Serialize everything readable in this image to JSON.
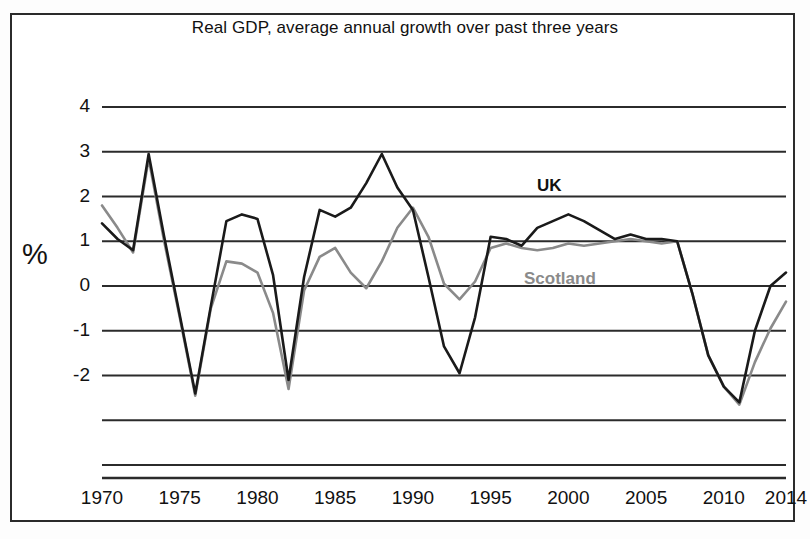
{
  "figure": {
    "title": "Real GDP, average annual growth over past three years",
    "ylabel": "%"
  },
  "legend": {
    "uk": "UK",
    "scotland": "Scotland"
  },
  "colors": {
    "uk": "#1a1a1a",
    "scotland": "#8a8a8a",
    "grid": "#2b2b2b",
    "frame": "#2b2b2b",
    "background": "#ffffff"
  },
  "axis": {
    "yticks": [
      "4",
      "3",
      "2",
      "1",
      "0",
      "-1",
      "-2"
    ],
    "ytick_values": [
      4,
      3,
      2,
      1,
      0,
      -1,
      -2
    ],
    "unlabeled_gridlines": [
      -3,
      -4
    ],
    "xticks": [
      "1970",
      "1975",
      "1980",
      "1985",
      "1990",
      "1995",
      "2000",
      "2005",
      "2010",
      "2014"
    ],
    "xtick_values": [
      1970,
      1975,
      1980,
      1985,
      1990,
      1995,
      2000,
      2005,
      2010,
      2014
    ]
  },
  "chart_data": {
    "type": "line",
    "title": "Real GDP, average annual growth over past three years",
    "xlabel": "",
    "ylabel": "%",
    "xlim": [
      1970,
      2014
    ],
    "ylim": [
      -4.3,
      4.3
    ],
    "grid": true,
    "legend_position": "inline-annotation",
    "x": [
      1970,
      1971,
      1972,
      1973,
      1974,
      1975,
      1976,
      1977,
      1978,
      1979,
      1980,
      1981,
      1982,
      1983,
      1984,
      1985,
      1986,
      1987,
      1988,
      1989,
      1990,
      1991,
      1992,
      1993,
      1994,
      1995,
      1996,
      1997,
      1998,
      1999,
      2000,
      2001,
      2002,
      2003,
      2004,
      2005,
      2006,
      2007,
      2008,
      2009,
      2010,
      2011,
      2012,
      2013,
      2014
    ],
    "series": [
      {
        "name": "UK",
        "color": "#1a1a1a",
        "values": [
          1.4,
          1.05,
          0.8,
          2.95,
          1.1,
          -0.65,
          -2.4,
          -0.45,
          1.45,
          1.6,
          1.5,
          0.25,
          -2.1,
          0.2,
          1.7,
          1.55,
          1.75,
          2.3,
          2.95,
          2.2,
          1.7,
          0.2,
          -1.35,
          -1.95,
          -0.7,
          1.1,
          1.05,
          0.9,
          1.3,
          1.45,
          1.6,
          1.45,
          1.25,
          1.05,
          1.15,
          1.05,
          1.05,
          1.0,
          -0.2,
          -1.55,
          -2.25,
          -2.6,
          -1.0,
          0.0,
          0.3
        ]
      },
      {
        "name": "Scotland",
        "color": "#8a8a8a",
        "values": [
          1.8,
          1.3,
          0.75,
          2.85,
          1.0,
          -0.7,
          -2.45,
          -0.5,
          0.55,
          0.5,
          0.3,
          -0.6,
          -2.3,
          -0.1,
          0.65,
          0.85,
          0.3,
          -0.05,
          0.55,
          1.3,
          1.75,
          1.1,
          0.05,
          -0.3,
          0.1,
          0.85,
          0.95,
          0.85,
          0.8,
          0.85,
          0.95,
          0.9,
          0.95,
          1.0,
          1.05,
          1.0,
          0.95,
          1.0,
          -0.2,
          -1.55,
          -2.25,
          -2.65,
          -1.7,
          -0.95,
          -0.35
        ]
      }
    ],
    "annotations": [
      {
        "text": "UK",
        "x": 1999,
        "y": 2.05,
        "color": "#1a1a1a"
      },
      {
        "text": "Scotland",
        "x": 2000,
        "y": 0.3,
        "color": "#8a8a8a"
      }
    ]
  }
}
